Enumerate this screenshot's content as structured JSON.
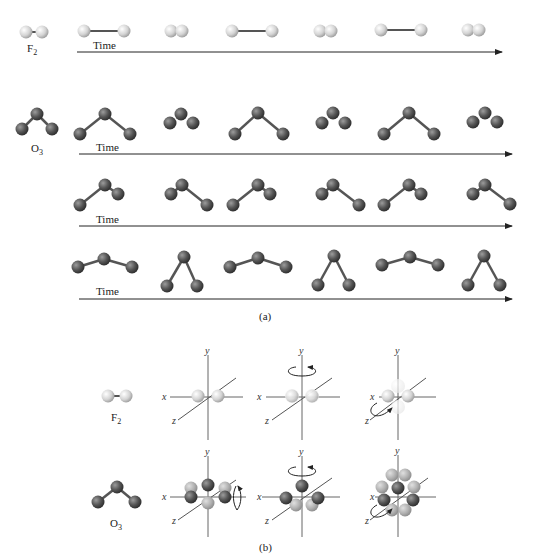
{
  "figure": {
    "panel_a": {
      "caption": "(a)",
      "time_label": "Time",
      "rows": [
        {
          "name": "f2-stretch",
          "molecule": "F₂",
          "molecule_base": "F",
          "molecule_sub": "2",
          "frames": [
            "compressed",
            "stretched",
            "compressed",
            "stretched",
            "compressed",
            "stretched",
            "compressed"
          ]
        },
        {
          "name": "o3-symmetric-stretch",
          "molecule": "O₃",
          "molecule_base": "O",
          "molecule_sub": "3",
          "frames": [
            "stretched",
            "compressed",
            "stretched",
            "compressed",
            "stretched",
            "compressed"
          ]
        },
        {
          "name": "o3-asymmetric-stretch",
          "frames": [
            "left-long",
            "right-long",
            "left-long",
            "right-long",
            "left-long",
            "right-long"
          ]
        },
        {
          "name": "o3-bend",
          "frames": [
            "open",
            "closed",
            "open",
            "closed",
            "open",
            "closed"
          ]
        }
      ]
    },
    "panel_b": {
      "caption": "(b)",
      "axis_labels": {
        "x": "x",
        "y": "y",
        "z": "z"
      },
      "rows": [
        {
          "molecule": "F₂",
          "molecule_base": "F",
          "molecule_sub": "2",
          "views": [
            "static",
            "rotation-about-y",
            "rotation-about-z"
          ]
        },
        {
          "molecule": "O₃",
          "molecule_base": "O",
          "molecule_sub": "3",
          "views": [
            "rotation-about-x",
            "rotation-about-y",
            "rotation-about-z"
          ]
        }
      ]
    },
    "colors": {
      "fluorine_atom": "#d4d4d4",
      "oxygen_atom": "#555555",
      "bond": "#555555",
      "axis": "#555555",
      "arrow": "#222222"
    }
  }
}
